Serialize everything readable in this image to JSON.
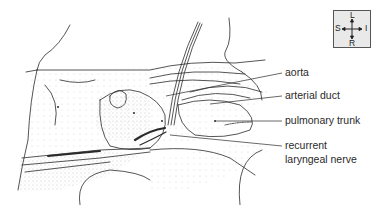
{
  "figure": {
    "labels": [
      {
        "id": "aorta",
        "text": "aorta",
        "x": 285,
        "y": 68
      },
      {
        "id": "arterial-duct",
        "text": "arterial duct",
        "x": 285,
        "y": 91
      },
      {
        "id": "pulmonary-trunk",
        "text": "pulmonary trunk",
        "x": 285,
        "y": 115
      },
      {
        "id": "recurrent-laryngeal-nerve-1",
        "text": "recurrent",
        "x": 285,
        "y": 141
      },
      {
        "id": "recurrent-laryngeal-nerve-2",
        "text": "laryngeal nerve",
        "x": 285,
        "y": 155
      }
    ],
    "orientation": {
      "top": "L",
      "left": "S",
      "right": "I",
      "bottom": "R"
    },
    "colors": {
      "line": "#2a2a2a",
      "stipple": "#9a9a9a",
      "compass_bg": "#e9e9e9"
    }
  }
}
